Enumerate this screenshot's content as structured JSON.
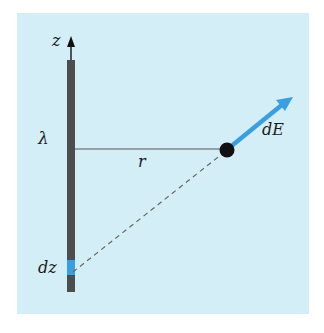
{
  "figure": {
    "labels": {
      "axis": "z",
      "charge_density": "λ",
      "distance": "r",
      "field_d": "d",
      "field_E": "E",
      "element": "dz"
    },
    "colors": {
      "background": "#d4eef7",
      "rod": "#4d4d4d",
      "segment": "#3a9fe0",
      "arrow": "#3a9fe0",
      "point": "#111111",
      "line": "#555555"
    }
  }
}
